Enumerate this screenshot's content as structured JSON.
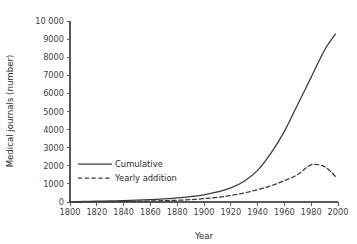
{
  "chart_data": {
    "type": "line",
    "title": "",
    "xlabel": "Year",
    "ylabel": "Medical journals (number)",
    "xlim": [
      1800,
      2000
    ],
    "ylim": [
      0,
      10000
    ],
    "grid": false,
    "legend_position": "center-left",
    "x_ticks": [
      1800,
      1820,
      1840,
      1860,
      1880,
      1900,
      1920,
      1940,
      1960,
      1980,
      2000
    ],
    "x_tick_labels": [
      "1800",
      "1820",
      "1840",
      "1860",
      "1880",
      "1900",
      "1920",
      "1940",
      "1960",
      "1980",
      "2000"
    ],
    "y_ticks": [
      0,
      1000,
      2000,
      3000,
      4000,
      5000,
      6000,
      7000,
      8000,
      9000,
      10000
    ],
    "y_tick_labels": [
      "0",
      "1000",
      "2000",
      "3000",
      "4000",
      "5000",
      "6000",
      "7000",
      "8000",
      "9000",
      "10 000"
    ],
    "x": [
      1800,
      1810,
      1820,
      1830,
      1840,
      1850,
      1860,
      1870,
      1880,
      1890,
      1900,
      1910,
      1920,
      1930,
      1940,
      1950,
      1960,
      1970,
      1980,
      1990,
      1998
    ],
    "series": [
      {
        "name": "Cumulative",
        "style": "solid",
        "color": "#3a3a3c",
        "values": [
          20,
          30,
          45,
          60,
          80,
          105,
          135,
          175,
          225,
          300,
          400,
          560,
          780,
          1150,
          1750,
          2700,
          3900,
          5400,
          6900,
          8400,
          9280
        ]
      },
      {
        "name": "Yearly addition",
        "style": "dashed",
        "color": "#3a3a3c",
        "values": [
          10,
          14,
          18,
          24,
          32,
          42,
          55,
          72,
          95,
          130,
          185,
          260,
          360,
          500,
          680,
          900,
          1180,
          1520,
          2050,
          1950,
          1420
        ]
      }
    ],
    "legend": [
      {
        "label": "Cumulative",
        "style": "solid"
      },
      {
        "label": "Yearly addition",
        "style": "dashed"
      }
    ]
  }
}
